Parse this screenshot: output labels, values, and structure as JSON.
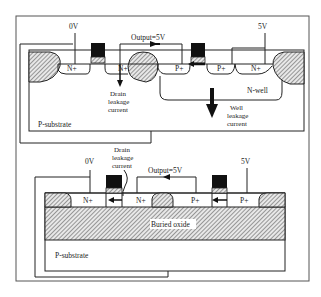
{
  "figure": {
    "type": "semiconductor-cross-section-comparison",
    "colors": {
      "line": "#222222",
      "hatch": "#555555",
      "gate": "#111111",
      "background": "#ffffff"
    }
  },
  "bulk_cmos": {
    "labels": {
      "vss": "0V",
      "vdd": "5V",
      "output": "Output=5V",
      "n_plus_source": "N+",
      "n_plus_drain": "N+",
      "p_plus_drain": "P+",
      "p_plus_source": "P+",
      "n_plus_tap": "N+",
      "nwell": "N-well",
      "substrate": "P-substrate",
      "drain_leakage": [
        "Drain",
        "leakage",
        "current"
      ],
      "well_leakage": [
        "Well",
        "leakage",
        "current"
      ]
    }
  },
  "soi_cmos": {
    "labels": {
      "vss": "0V",
      "vdd": "5V",
      "output": "Output=5V",
      "n_plus_source": "N+",
      "n_plus_drain": "N+",
      "p_plus_drain": "P+",
      "p_plus_source": "P+",
      "buried_oxide": "Buried oxide",
      "substrate": "P-substrate",
      "drain_leakage": [
        "Drain",
        "leakage",
        "current"
      ]
    }
  }
}
